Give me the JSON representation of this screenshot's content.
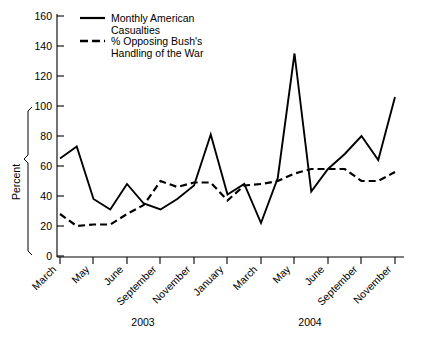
{
  "chart_data": {
    "type": "line",
    "title": "",
    "xlabel": "",
    "ylabel": "Percent",
    "ylim": [
      0,
      160
    ],
    "yticks": [
      0,
      20,
      40,
      60,
      80,
      100,
      120,
      140,
      160
    ],
    "grid": false,
    "legend_position": "top-left",
    "x": [
      "March 2003",
      "April 2003",
      "May 2003",
      "June 2003",
      "July 2003",
      "August 2003",
      "September 2003",
      "October 2003",
      "November 2003",
      "December 2003",
      "January 2004",
      "February 2004",
      "March 2004",
      "April 2004",
      "May 2004",
      "June 2004",
      "July 2004",
      "August 2004",
      "September 2004",
      "October 2004",
      "November 2004"
    ],
    "xtick_labels": [
      "March",
      "May",
      "June",
      "September",
      "November",
      "January",
      "March",
      "May",
      "June",
      "September",
      "November"
    ],
    "group_labels": [
      "2003",
      "2004"
    ],
    "series": [
      {
        "name": "Monthly American Casualties",
        "style": "solid",
        "values": [
          65,
          73,
          38,
          31,
          48,
          35,
          31,
          38,
          47,
          81,
          41,
          48,
          22,
          52,
          135,
          43,
          58,
          68,
          80,
          64,
          106
        ]
      },
      {
        "name": "% Opposing Bush's Handling of the War",
        "style": "dashed",
        "values": [
          28,
          20,
          21,
          21,
          28,
          34,
          50,
          46,
          49,
          49,
          37,
          47,
          48,
          50,
          55,
          58,
          58,
          58,
          50,
          50,
          56
        ]
      }
    ]
  },
  "legend": {
    "items": [
      {
        "label_line1": "Monthly American",
        "label_line2": "Casualties",
        "style": "solid"
      },
      {
        "label_line1": "% Opposing Bush's",
        "label_line2": "Handling of the War",
        "style": "dashed"
      }
    ]
  },
  "axes": {
    "y_title": "Percent"
  }
}
